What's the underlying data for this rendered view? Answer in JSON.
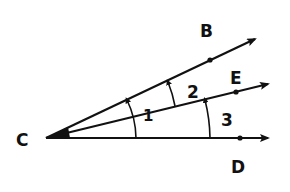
{
  "diagram": {
    "type": "angle-diagram",
    "vertex": {
      "label": "C",
      "x": 46,
      "y": 138
    },
    "rays": [
      {
        "name": "ray-CB",
        "point_label": "B",
        "end": [
          258,
          38
        ],
        "dot": [
          210,
          60
        ],
        "label_pos": [
          200,
          37
        ]
      },
      {
        "name": "ray-CE",
        "point_label": "E",
        "end": [
          271,
          83
        ],
        "dot": [
          236,
          92
        ],
        "label_pos": [
          230,
          83
        ]
      },
      {
        "name": "ray-CD",
        "point_label": "D",
        "end": [
          271,
          138
        ],
        "dot": [
          240,
          138
        ],
        "label_pos": [
          230,
          172
        ]
      }
    ],
    "angles": [
      {
        "label": "1",
        "from": "CD",
        "to": "CB",
        "label_pos": [
          146,
          116
        ]
      },
      {
        "label": "2",
        "from": "CE",
        "to": "CB",
        "label_pos": [
          188,
          96
        ]
      },
      {
        "label": "3",
        "from": "CD",
        "to": "CE",
        "label_pos": [
          221,
          124
        ]
      }
    ],
    "stroke_color": "#111111"
  }
}
